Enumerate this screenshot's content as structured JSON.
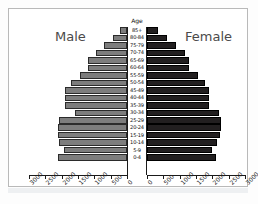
{
  "chart_data": {
    "type": "bar",
    "title": "",
    "subtitle": "",
    "orientation": "horizontal",
    "layout": "population-pyramid",
    "center_axis_title": "Age",
    "xlabel": "",
    "ylabel": "Age",
    "xlim": [
      0,
      3000
    ],
    "grid": false,
    "legend_position": "inline-top",
    "tick_step": 500,
    "left_tick_labels": [
      "3000",
      "2500",
      "2000",
      "1500",
      "1000",
      "500",
      "0"
    ],
    "right_tick_labels": [
      "0",
      "500",
      "1000",
      "1500",
      "2000",
      "2500",
      "3000"
    ],
    "categories": [
      "85+",
      "80-84",
      "75-79",
      "70-74",
      "65-69",
      "60-64",
      "55-59",
      "50-54",
      "45-49",
      "40-44",
      "35-39",
      "30-34",
      "25-29",
      "20-24",
      "15-19",
      "10-14",
      "5-9",
      "0-4"
    ],
    "series": [
      {
        "name": "Male",
        "side": "left",
        "color": "#7d7d7d",
        "values": [
          220,
          430,
          690,
          950,
          1180,
          1200,
          1450,
          1700,
          1900,
          1900,
          1900,
          1580,
          2080,
          2120,
          2120,
          2080,
          1930,
          2100
        ]
      },
      {
        "name": "Female",
        "side": "right",
        "color": "#221f20",
        "values": [
          330,
          620,
          900,
          1150,
          1300,
          1280,
          1560,
          1780,
          1900,
          1900,
          1900,
          2200,
          2280,
          2250,
          2230,
          2130,
          1980,
          2120
        ]
      }
    ]
  },
  "labels": {
    "male": "Male",
    "female": "Female",
    "age": "Age"
  }
}
